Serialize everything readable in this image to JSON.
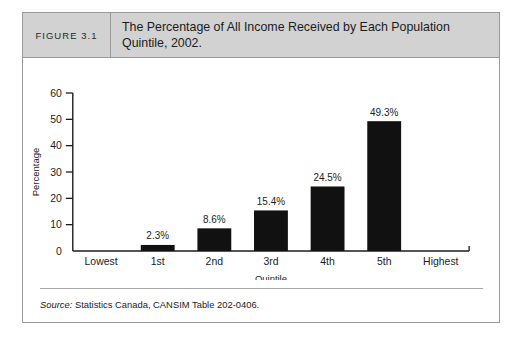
{
  "figure": {
    "number_label": "FIGURE 3.1",
    "title": "The Percentage of All Income Received by Each Population Quintile, 2002.",
    "source_prefix": "Source:",
    "source_text": "Statistics Canada, CANSIM Table 202-0406."
  },
  "chart_data": {
    "type": "bar",
    "title": "The Percentage of All Income Received by Each Population Quintile, 2002.",
    "xlabel": "Quintile",
    "ylabel": "Percentage",
    "categories": [
      "1st",
      "2nd",
      "3rd",
      "4th",
      "5th"
    ],
    "values": [
      2.3,
      8.6,
      15.4,
      24.5,
      49.3
    ],
    "data_labels": [
      "2.3%",
      "8.6%",
      "15.4%",
      "24.5%",
      "49.3%"
    ],
    "axis_endpoint_labels": {
      "left": "Lowest",
      "right": "Highest"
    },
    "xtick_labels": [
      "Lowest",
      "1st",
      "2nd",
      "3rd",
      "4th",
      "5th",
      "Highest"
    ],
    "ylim": [
      0,
      60
    ],
    "ytick_labels": [
      "0",
      "10",
      "20",
      "30",
      "40",
      "50",
      "60"
    ],
    "ytick_values": [
      0,
      10,
      20,
      30,
      40,
      50,
      60
    ],
    "grid": false,
    "legend": "none",
    "bar_color": "#111111"
  }
}
